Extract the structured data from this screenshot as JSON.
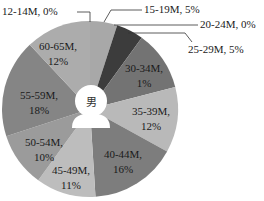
{
  "chart_data": {
    "type": "pie",
    "title": "",
    "center_label": "男",
    "center_icon": "person-silhouette-icon",
    "start_angle_deg": 0,
    "direction": "clockwise",
    "slices": [
      {
        "label": "12-14M",
        "value": 0,
        "text": "12-14M, 0%",
        "color": "#9a9a9a",
        "placement": "outside"
      },
      {
        "label": "15-19M",
        "value": 5,
        "text": "15-19M, 5%",
        "color": "#a8a8a8",
        "placement": "outside"
      },
      {
        "label": "20-24M",
        "value": 0,
        "text": "20-24M, 0%",
        "color": "#8a8a8a",
        "placement": "outside"
      },
      {
        "label": "25-29M",
        "value": 5,
        "text": "25-29M, 5%",
        "color": "#3c3c3c",
        "placement": "outside"
      },
      {
        "label": "30-34M",
        "value": 11,
        "text1": "30-34M,",
        "text2": "1%",
        "color": "#737373",
        "placement": "inside"
      },
      {
        "label": "35-39M",
        "value": 12,
        "text1": "35-39M,",
        "text2": "12%",
        "color": "#b9b9b9",
        "placement": "inside"
      },
      {
        "label": "40-44M",
        "value": 16,
        "text1": "40-44M,",
        "text2": "16%",
        "color": "#7d7d7d",
        "placement": "inside"
      },
      {
        "label": "45-49M",
        "value": 11,
        "text1": "45-49M,",
        "text2": "11%",
        "color": "#bdbdbd",
        "placement": "inside"
      },
      {
        "label": "50-54M",
        "value": 10,
        "text1": "50-54M,",
        "text2": "10%",
        "color": "#9b9b9b",
        "placement": "inside"
      },
      {
        "label": "55-59M",
        "value": 18,
        "text1": "55-59M,",
        "text2": "18%",
        "color": "#858585",
        "placement": "inside"
      },
      {
        "label": "60-65M",
        "value": 12,
        "text1": "60-65M,",
        "text2": "12%",
        "color": "#acacac",
        "placement": "inside"
      }
    ],
    "legend": "none"
  },
  "labels": {
    "center": "男",
    "outside": {
      "l1214": "12-14M, 0%",
      "l1519": "15-19M, 5%",
      "l2024": "20-24M, 0%",
      "l2529": "25-29M, 5%"
    },
    "inside": {
      "l3034a": "30-34M,",
      "l3034b": "1%",
      "l3539a": "35-39M,",
      "l3539b": "12%",
      "l4044a": "40-44M,",
      "l4044b": "16%",
      "l4549a": "45-49M,",
      "l4549b": "11%",
      "l5054a": "50-54M,",
      "l5054b": "10%",
      "l5559a": "55-59M,",
      "l5559b": "18%",
      "l6065a": "60-65M,",
      "l6065b": "12%"
    }
  }
}
